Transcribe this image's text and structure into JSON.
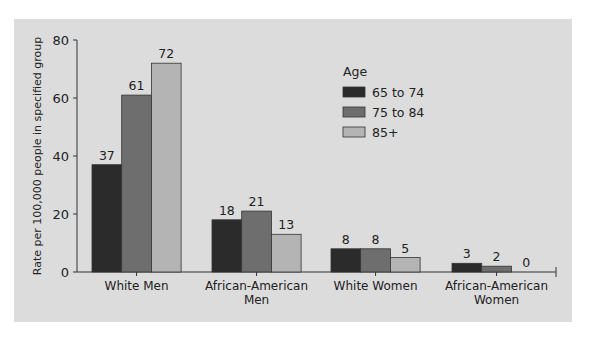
{
  "chart_data": {
    "type": "bar",
    "title": "",
    "xlabel": "",
    "ylabel": "Rate per 100,000 people in specified group",
    "ylim": [
      0,
      80
    ],
    "yticks": [
      0,
      20,
      40,
      60,
      80
    ],
    "grid": false,
    "legend_title": "Age",
    "legend_position": "upper-right-inside",
    "categories": [
      "White Men",
      "African-American Men",
      "White Women",
      "African-American Women"
    ],
    "category_lines": [
      [
        "White Men"
      ],
      [
        "African-American",
        "Men"
      ],
      [
        "White Women"
      ],
      [
        "African-American",
        "Women"
      ]
    ],
    "series": [
      {
        "name": "65 to 74",
        "color": "#2b2b2b",
        "values": [
          37,
          18,
          8,
          3
        ]
      },
      {
        "name": "75 to 84",
        "color": "#6e6e6e",
        "values": [
          61,
          21,
          8,
          2
        ]
      },
      {
        "name": "85+",
        "color": "#b4b4b4",
        "values": [
          72,
          13,
          5,
          0
        ]
      }
    ]
  }
}
